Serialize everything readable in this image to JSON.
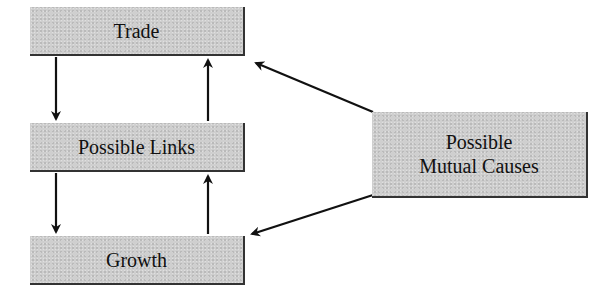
{
  "diagram": {
    "nodes": [
      {
        "id": "trade",
        "label": "Trade"
      },
      {
        "id": "links",
        "label": "Possible Links"
      },
      {
        "id": "growth",
        "label": "Growth"
      },
      {
        "id": "causes",
        "label_line1": "Possible",
        "label_line2": "Mutual Causes"
      }
    ],
    "edges": [
      {
        "from": "trade",
        "to": "links"
      },
      {
        "from": "links",
        "to": "trade"
      },
      {
        "from": "links",
        "to": "growth"
      },
      {
        "from": "growth",
        "to": "links"
      },
      {
        "from": "causes",
        "to": "trade"
      },
      {
        "from": "causes",
        "to": "growth"
      }
    ],
    "colors": {
      "box_fill": "#cfcfcf",
      "arrow": "#111111",
      "text": "#111111"
    }
  }
}
